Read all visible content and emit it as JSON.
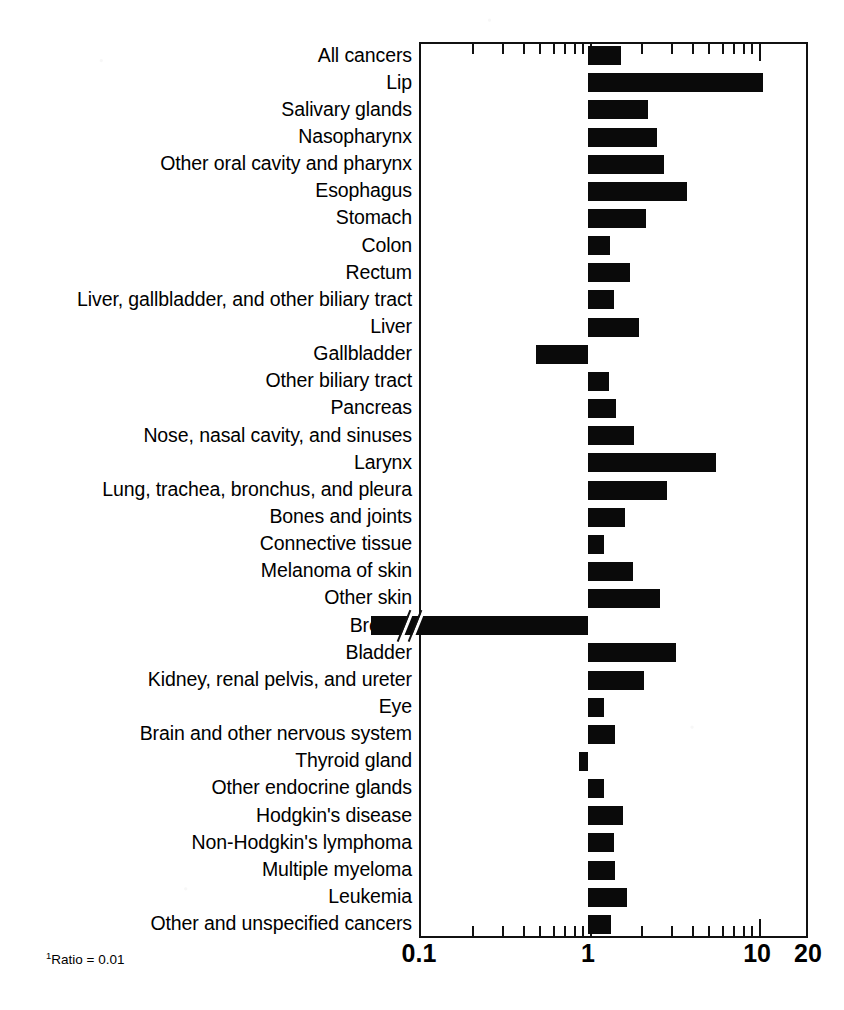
{
  "figure": {
    "footnote": "Ratio = 0.01",
    "footnote_marker": "1",
    "bar_color": "#0a0a0a",
    "axis_color": "#111111",
    "background": "#ffffff"
  },
  "chart_data": {
    "type": "bar",
    "orientation": "horizontal",
    "title": "",
    "subtitle": "",
    "xlabel": "",
    "ylabel": "",
    "xscale": "log",
    "xlim": [
      0.1,
      20
    ],
    "xticks_labeled": [
      "0.1",
      "1",
      "10",
      "20"
    ],
    "xtick_values": [
      0.1,
      1,
      10,
      20
    ],
    "reference_line": 1,
    "grid": false,
    "legend": null,
    "annotations": [
      {
        "text": "axis break on Breast bar",
        "category": "Breast",
        "note": "bar value 0.01 is off-scale; bar drawn through a broken axis marker"
      }
    ],
    "categories": [
      "All cancers",
      "Lip",
      "Salivary glands",
      "Nasopharynx",
      "Other oral cavity and pharynx",
      "Esophagus",
      "Stomach",
      "Colon",
      "Rectum",
      "Liver, gallbladder, and other biliary tract",
      "Liver",
      "Gallbladder",
      "Other  biliary tract",
      "Pancreas",
      "Nose, nasal cavity, and sinuses",
      "Larynx",
      "Lung, trachea, bronchus, and pleura",
      "Bones and joints",
      "Connective tissue",
      "Melanoma of skin",
      "Other skin",
      "Breast",
      "Bladder",
      "Kidney, renal pelvis, and ureter",
      "Eye",
      "Brain and other nervous system",
      "Thyroid gland",
      "Other endocrine glands",
      "Hodgkin's disease",
      "Non-Hodgkin's lymphoma",
      "Multiple myeloma",
      "Leukemia",
      "Other and unspecified cancers"
    ],
    "values": [
      1.57,
      10.9,
      2.25,
      2.55,
      2.8,
      3.85,
      2.2,
      1.35,
      1.78,
      1.42,
      2.0,
      0.49,
      1.33,
      1.47,
      1.88,
      5.7,
      2.95,
      1.65,
      1.25,
      1.85,
      2.65,
      0.01,
      3.3,
      2.15,
      1.25,
      1.45,
      0.88,
      1.24,
      1.62,
      1.42,
      1.45,
      1.7,
      1.37
    ],
    "value_notes": {
      "Breast": "Ratio = 0.01 (footnote 1)"
    }
  },
  "labels": [
    {
      "text": "All cancers",
      "sup": ""
    },
    {
      "text": "Lip",
      "sup": ""
    },
    {
      "text": "Salivary glands",
      "sup": ""
    },
    {
      "text": "Nasopharynx",
      "sup": ""
    },
    {
      "text": "Other oral cavity and pharynx",
      "sup": ""
    },
    {
      "text": "Esophagus",
      "sup": ""
    },
    {
      "text": "Stomach",
      "sup": ""
    },
    {
      "text": "Colon",
      "sup": ""
    },
    {
      "text": "Rectum",
      "sup": ""
    },
    {
      "text": "Liver, gallbladder, and other biliary tract",
      "sup": ""
    },
    {
      "text": "Liver",
      "sup": ""
    },
    {
      "text": "Gallbladder",
      "sup": ""
    },
    {
      "text": "Other  biliary tract",
      "sup": ""
    },
    {
      "text": "Pancreas",
      "sup": ""
    },
    {
      "text": "Nose, nasal cavity, and sinuses",
      "sup": ""
    },
    {
      "text": "Larynx",
      "sup": ""
    },
    {
      "text": "Lung, trachea, bronchus, and pleura",
      "sup": ""
    },
    {
      "text": "Bones and joints",
      "sup": ""
    },
    {
      "text": "Connective tissue",
      "sup": ""
    },
    {
      "text": "Melanoma of skin",
      "sup": ""
    },
    {
      "text": "Other skin",
      "sup": ""
    },
    {
      "text": "Breast",
      "sup": "1"
    },
    {
      "text": "Bladder",
      "sup": ""
    },
    {
      "text": "Kidney, renal pelvis, and ureter",
      "sup": ""
    },
    {
      "text": "Eye",
      "sup": ""
    },
    {
      "text": "Brain and other nervous system",
      "sup": ""
    },
    {
      "text": "Thyroid gland",
      "sup": ""
    },
    {
      "text": "Other endocrine glands",
      "sup": ""
    },
    {
      "text": "Hodgkin's disease",
      "sup": ""
    },
    {
      "text": "Non-Hodgkin's lymphoma",
      "sup": ""
    },
    {
      "text": "Multiple myeloma",
      "sup": ""
    },
    {
      "text": "Leukemia",
      "sup": ""
    },
    {
      "text": "Other and unspecified cancers",
      "sup": ""
    }
  ]
}
